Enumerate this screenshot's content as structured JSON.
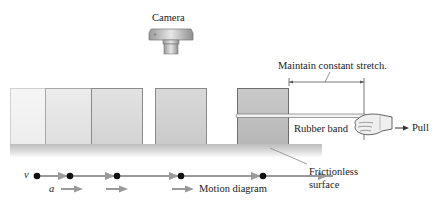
{
  "figure": {
    "camera": {
      "label": "Camera",
      "icon": "camera-icon"
    },
    "stretch_annotation": {
      "label": "Maintain constant stretch."
    },
    "rubber_band": {
      "label": "Rubber band"
    },
    "pull": {
      "label": "Pull",
      "icon": "hand-icon"
    },
    "surface": {
      "line1": "Frictionless",
      "line2": "surface"
    },
    "blocks": [
      {
        "index": 1,
        "shade": "#f1f1f1"
      },
      {
        "index": 2,
        "shade": "#e4e4e4"
      },
      {
        "index": 3,
        "shade": "#d6d6d6"
      },
      {
        "index": 4,
        "shade": "#cccccc"
      },
      {
        "index": 5,
        "shade": "#bdbdbd"
      }
    ],
    "motion_diagram": {
      "label": "Motion diagram",
      "velocity_symbol": "v⃗",
      "acceleration_symbol": "a⃗",
      "dots": 5
    }
  }
}
